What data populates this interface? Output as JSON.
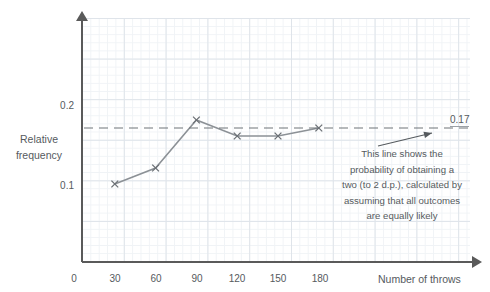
{
  "chart_data": {
    "type": "line",
    "title": "",
    "subtitle": "",
    "xlabel": "Number of throws",
    "ylabel": "Relative frequency",
    "ylabel_line1": "Relative",
    "ylabel_line2": "frequency",
    "x": [
      30,
      60,
      90,
      120,
      150,
      180
    ],
    "values": [
      0.1,
      0.12,
      0.18,
      0.16,
      0.16,
      0.17
    ],
    "series": [
      {
        "name": "Relative frequency of a two",
        "x": [
          30,
          60,
          90,
          120,
          150,
          180
        ],
        "values": [
          0.1,
          0.12,
          0.18,
          0.16,
          0.16,
          0.17
        ],
        "marker": "x",
        "color": "#8c9196"
      }
    ],
    "xlim": [
      0,
      280
    ],
    "ylim": [
      0,
      0.3
    ],
    "xticks": [
      0,
      30,
      60,
      90,
      120,
      150,
      180
    ],
    "xtick_labels": [
      "0",
      "30",
      "60",
      "90",
      "120",
      "150",
      "180"
    ],
    "yticks": [
      0.1,
      0.2
    ],
    "ytick_labels": [
      "0.1",
      "0.2"
    ],
    "grid": true,
    "legend": false,
    "reference_line": {
      "value": 0.17,
      "label": "0.17",
      "style": "dashed",
      "color": "#6e7479"
    },
    "annotations": [
      {
        "text_lines": [
          "This line shows the",
          "probability of obtaining a",
          "two (to 2 d.p.), calculated by",
          "assuming that all outcomes",
          "are equally likely"
        ],
        "points_to": "reference_line"
      }
    ]
  },
  "axes": {
    "y_ticks": [
      {
        "label": "0.2",
        "value": 0.2,
        "top": 100
      },
      {
        "label": "0.1",
        "value": 0.1,
        "top": 180
      }
    ],
    "x_ticks": [
      {
        "label": "0",
        "value": 0,
        "left": 59
      },
      {
        "label": "30",
        "value": 30,
        "left": 100
      },
      {
        "label": "60",
        "value": 60,
        "left": 141
      },
      {
        "label": "90",
        "value": 90,
        "left": 182
      },
      {
        "label": "120",
        "value": 120,
        "left": 222
      },
      {
        "label": "150",
        "value": 150,
        "left": 263
      },
      {
        "label": "180",
        "value": 180,
        "left": 305
      }
    ]
  },
  "annotation": {
    "line1": "This line shows the",
    "line2": "probability of obtaining a",
    "line3": "two (to 2 d.p.), calculated by",
    "line4": "assuming that all outcomes",
    "line5": "are equally likely"
  },
  "reference": {
    "label": "0.17"
  },
  "colors": {
    "series_line": "#8c9196",
    "axis": "#5a5a5a",
    "grid_major": "#dfe4ea",
    "grid_minor": "#f0f3f6",
    "text": "#555a5e",
    "dashed_line": "#6e7479",
    "background": "#ffffff"
  }
}
